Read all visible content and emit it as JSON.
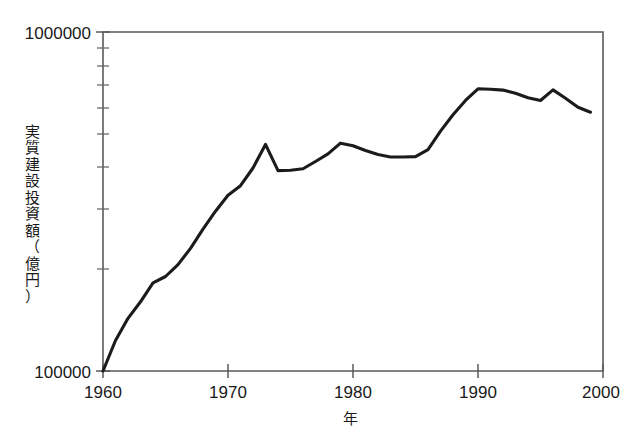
{
  "chart_data": {
    "type": "line",
    "title": "",
    "xlabel": "年",
    "ylabel": "実質建設投資額（億円）",
    "yscale": "log",
    "xlim": [
      1960,
      2000
    ],
    "ylim": [
      100000,
      1000000
    ],
    "xticks": [
      "1960",
      "1970",
      "1980",
      "1990",
      "2000"
    ],
    "xtick_values": [
      1960,
      1970,
      1980,
      1990,
      2000
    ],
    "yticks": [
      "100000",
      "1000000"
    ],
    "ytick_values": [
      100000,
      1000000
    ],
    "y_minor_ticks": [
      200000,
      300000,
      400000,
      500000,
      600000,
      700000,
      800000,
      900000
    ],
    "grid": false,
    "legend": false,
    "x": [
      1960,
      1961,
      1962,
      1963,
      1964,
      1965,
      1966,
      1967,
      1968,
      1969,
      1970,
      1971,
      1972,
      1973,
      1974,
      1975,
      1976,
      1977,
      1978,
      1979,
      1980,
      1981,
      1982,
      1983,
      1984,
      1985,
      1986,
      1987,
      1988,
      1989,
      1990,
      1991,
      1992,
      1993,
      1994,
      1995,
      1996,
      1997,
      1998,
      1999
    ],
    "series": [
      {
        "name": "実質建設投資額",
        "values": [
          100000,
          123000,
          143000,
          160000,
          182000,
          190000,
          206000,
          230000,
          262000,
          296000,
          330000,
          352000,
          397000,
          466000,
          390000,
          391000,
          395000,
          415000,
          437000,
          470000,
          462000,
          447000,
          435000,
          428000,
          428000,
          429000,
          450000,
          510000,
          570000,
          628000,
          680000,
          678000,
          674000,
          660000,
          640000,
          628000,
          675000,
          638000,
          600000,
          580000
        ]
      }
    ],
    "annotations": []
  },
  "axis": {
    "y_top_label": "1000000",
    "y_bottom_label": "100000",
    "x_labels": [
      "1960",
      "1970",
      "1980",
      "1990",
      "2000"
    ],
    "y_title": "実質建設投資額（億円）",
    "x_title": "年"
  },
  "colors": {
    "line": "#1b1b1b",
    "axis": "#5a5a5a",
    "text": "#1a1a1a",
    "background": "#ffffff"
  }
}
